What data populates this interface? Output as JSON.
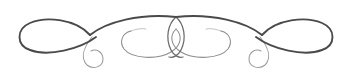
{
  "figure": {
    "kind": "decorative-flourish-ornament",
    "description": "Symmetric pen-drawn scroll ornament with two large outer teardrop loops, two overlapping inner ellipses at the center, a long S-curve sweep crossing at the top center, and small descending curls below each outer crossing.",
    "width": 352,
    "height": 78,
    "orientation": "horizontal",
    "symmetry": "bilateral-left-right"
  },
  "colors": {
    "background": "#ffffff",
    "ink_dark": "#4a4a4a",
    "ink_mid": "#6b6b6b",
    "ink_light": "#9a9a9a",
    "ink_faint": "#b5b5b5"
  },
  "strokes": {
    "heavy_width": 1.9,
    "medium_width": 1.3,
    "light_width": 1.0,
    "faint_width": 0.8
  },
  "geometry": {
    "left_outer_loop": {
      "name": "left-outer-teardrop-loop",
      "tip_x": 22,
      "top_y": 21,
      "bottom_y": 52,
      "crossing_x": 90,
      "crossing_y": 35
    },
    "right_outer_loop": {
      "name": "right-outer-teardrop-loop",
      "tip_x": 330,
      "top_y": 21,
      "bottom_y": 52,
      "crossing_x": 262,
      "crossing_y": 35
    },
    "left_curl": {
      "name": "left-descending-curl",
      "top_y": 36,
      "bottom_y": 68,
      "center_x": 95
    },
    "right_curl": {
      "name": "right-descending-curl",
      "top_y": 36,
      "bottom_y": 68,
      "center_x": 257
    },
    "top_crossing": {
      "name": "center-top-crossing",
      "x": 176,
      "y": 17
    },
    "left_inner_ellipse": {
      "name": "left-inner-ellipse",
      "left_x": 120,
      "right_x": 186,
      "top_y": 28,
      "bottom_y": 58
    },
    "right_inner_ellipse": {
      "name": "right-inner-ellipse",
      "left_x": 166,
      "right_x": 232,
      "top_y": 28,
      "bottom_y": 58
    },
    "center_lens": {
      "name": "center-overlap-lens",
      "left_x": 166,
      "right_x": 186,
      "top_y": 28,
      "bottom_y": 58
    }
  },
  "paths": {
    "left_outer_loop": "M 90 35 C 76 19 46 16 30 23 C 16 29 16 45 30 50 C 48 57 80 49 96 37",
    "left_sweep": "M 90 35 C 106 22 140 13 176 17",
    "left_curl": "M 92 37 C 84 47 80 58 87 65 C 93 70 103 67 103 59 C 103 52 96 48 91 51",
    "left_inner_ellipse": "M 131 31 C 122 33 119 42 124 49 C 132 59 158 60 171 52 C 181 46 183 36 176 29",
    "left_inner_tail": "M 131 31 C 136 29 142 28 146 29",
    "right_outer_loop": "M 262 35 C 276 19 306 16 322 23 C 336 29 336 45 322 50 C 304 57 272 49 256 37",
    "right_sweep": "M 262 35 C 246 22 212 13 176 17",
    "right_curl": "M 260 37 C 268 47 272 58 265 65 C 259 70 249 67 249 59 C 249 52 256 48 261 51",
    "right_inner_ellipse": "M 221 31 C 230 33 233 42 228 49 C 220 59 194 60 181 52 C 171 46 169 36 176 29",
    "right_inner_tail": "M 221 31 C 216 29 210 28 206 29",
    "center_left_arc": "M 176 17 C 168 24 165 38 171 50 C 174 56 179 58 183 57",
    "center_right_arc": "M 176 17 C 184 24 187 38 181 50 C 178 56 173 58 169 57"
  }
}
